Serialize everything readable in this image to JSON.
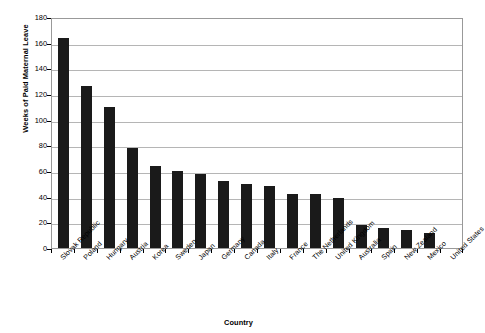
{
  "chart_data": {
    "type": "bar",
    "title": "",
    "xlabel": "Country",
    "ylabel": "Weeks of Paid Maternal Leave",
    "ylim": [
      0,
      180
    ],
    "ytick_step": 20,
    "yticks": [
      0,
      20,
      40,
      60,
      80,
      100,
      120,
      140,
      160,
      180
    ],
    "ytick_labels": [
      "0",
      "20",
      "40",
      "60",
      "80",
      "100",
      "120",
      "140",
      "160",
      "180"
    ],
    "grid": true,
    "grid_axis": "y",
    "legend": false,
    "legend_position": "none",
    "bar_color": "#1a1a1a",
    "gridline_color": "#b5b5b5",
    "frame_color": "#999999",
    "background": "#ffffff",
    "categories": [
      "Slovak Republic",
      "Poland",
      "Hungary",
      "Austria",
      "Korea",
      "Sweden",
      "Japan",
      "Germany",
      "Canada",
      "Italy",
      "France",
      "The Netherlands",
      "United Kingdom",
      "Australia",
      "Spain",
      "New Zealand",
      "Mexico",
      "United States"
    ],
    "values": [
      164,
      126,
      110,
      78,
      64,
      60,
      58,
      52,
      50,
      48,
      42,
      42,
      39,
      18,
      16,
      14,
      12,
      0
    ]
  }
}
